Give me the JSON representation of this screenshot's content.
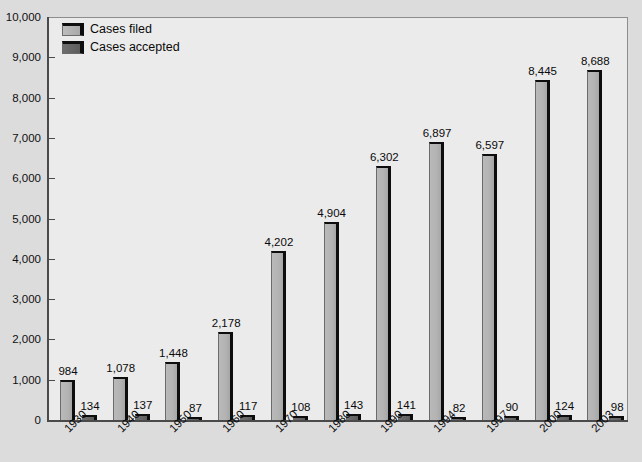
{
  "chart_data": {
    "type": "bar",
    "title": "",
    "subtitle": "",
    "xlabel": "",
    "ylabel": "",
    "ylim": [
      0,
      10000
    ],
    "ytick_labels": [
      "10,000",
      "9,000",
      "8,000",
      "7,000",
      "6,000",
      "5,000",
      "4,000",
      "3,000",
      "2,000",
      "1,000",
      "0"
    ],
    "ytick_values": [
      10000,
      9000,
      8000,
      7000,
      6000,
      5000,
      4000,
      3000,
      2000,
      1000,
      0
    ],
    "grid": false,
    "legend_position": "top-left",
    "categories": [
      "1930",
      "1940",
      "1950",
      "1960",
      "1970",
      "1980",
      "1990",
      "1994",
      "1997",
      "2000",
      "2003"
    ],
    "series": [
      {
        "name": "Cases filed",
        "color": "#b3b3b3",
        "values": [
          984,
          1078,
          1448,
          2178,
          4202,
          4904,
          6302,
          6897,
          6597,
          8445,
          8688
        ],
        "labels": [
          "984",
          "1,078",
          "1,448",
          "2,178",
          "4,202",
          "4,904",
          "6,302",
          "6,897",
          "6,597",
          "8,445",
          "8,688"
        ]
      },
      {
        "name": "Cases accepted",
        "color": "#666666",
        "values": [
          134,
          137,
          87,
          117,
          108,
          143,
          141,
          82,
          90,
          124,
          98
        ],
        "labels": [
          "134",
          "137",
          "87",
          "117",
          "108",
          "143",
          "141",
          "82",
          "90",
          "124",
          "98"
        ]
      }
    ]
  },
  "legend": {
    "items": [
      {
        "label": "Cases filed",
        "swatch": "filed"
      },
      {
        "label": "Cases accepted",
        "swatch": "accepted"
      }
    ]
  }
}
